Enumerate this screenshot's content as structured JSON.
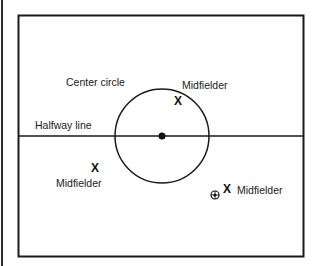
{
  "diagram": {
    "type": "soccer-field-midfield-section",
    "labels": {
      "center_circle": "Center circle",
      "halfway_line": "Halfway line"
    },
    "players": [
      {
        "role": "Midfielder",
        "marker": "X",
        "position": "inside-center-circle-top-right"
      },
      {
        "role": "Midfielder",
        "marker": "X",
        "position": "left-below-halfway"
      },
      {
        "role": "Midfielder",
        "marker": "X",
        "position": "right-below-halfway",
        "has_ball": true
      }
    ],
    "icons": {
      "center_spot": "filled-dot",
      "ball": "soccer-ball-icon",
      "player": "X"
    },
    "colors": {
      "line": "#1a1a1a",
      "background": "#ffffff"
    }
  }
}
